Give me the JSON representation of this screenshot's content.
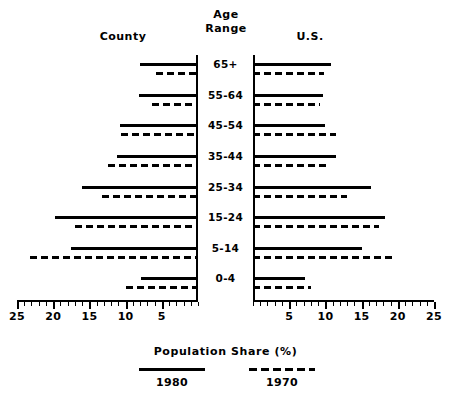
{
  "headers": {
    "left": "County",
    "center_line1": "Age",
    "center_line2": "Range",
    "right": "U.S."
  },
  "axis_title": "Population Share (%)",
  "legend": {
    "solid": {
      "label": "1980",
      "style": "solid-line"
    },
    "dashed": {
      "label": "1970",
      "style": "dashed-line"
    }
  },
  "tick_labels_left": [
    "25",
    "20",
    "15",
    "10",
    "5"
  ],
  "tick_labels_right": [
    "5",
    "10",
    "15",
    "20",
    "25"
  ],
  "chart_data": {
    "type": "bar",
    "subtype": "population-pyramid",
    "title": "",
    "xlabel": "Population Share (%)",
    "ylabel": "Age Range",
    "orientation": "horizontal",
    "grid": false,
    "legend_position": "bottom",
    "xlim_left": [
      0,
      25
    ],
    "xlim_right": [
      0,
      25
    ],
    "tick_interval_major": 5,
    "tick_interval_minor": 1,
    "categories": [
      "65+",
      "55-64",
      "45-54",
      "35-44",
      "25-34",
      "15-24",
      "5-14",
      "0-4"
    ],
    "panels": [
      {
        "name": "County",
        "side": "left",
        "series": [
          {
            "name": "1980",
            "style": "solid",
            "values": [
              8.0,
              8.2,
              10.8,
              11.2,
              16.0,
              19.7,
              17.5,
              7.9
            ]
          },
          {
            "name": "1970",
            "style": "dashed",
            "values": [
              5.8,
              6.3,
              10.6,
              12.5,
              13.2,
              17.0,
              23.2,
              10.0
            ]
          }
        ]
      },
      {
        "name": "U.S.",
        "side": "right",
        "series": [
          {
            "name": "1980",
            "style": "solid",
            "values": [
              10.8,
              9.6,
              10.0,
              11.4,
              16.3,
              18.3,
              15.0,
              7.2
            ]
          },
          {
            "name": "1970",
            "style": "dashed",
            "values": [
              9.8,
              9.2,
              11.4,
              10.7,
              13.0,
              17.4,
              19.8,
              8.0
            ]
          }
        ]
      }
    ]
  },
  "colors": {
    "ink": "#000000",
    "background": "#ffffff"
  }
}
